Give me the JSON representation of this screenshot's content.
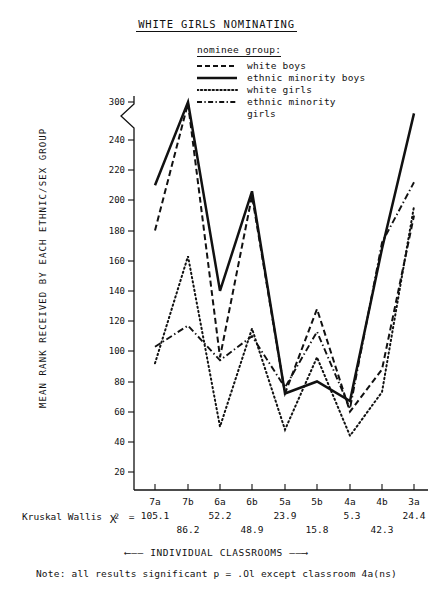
{
  "title": "WHITE GIRLS NOMINATING",
  "legend": {
    "heading": "nominee group:",
    "items": [
      {
        "label": "white boys",
        "style": "dashed"
      },
      {
        "label": "ethnic minority boys",
        "style": "solid"
      },
      {
        "label": "white girls",
        "style": "dotted"
      },
      {
        "label": "ethnic minority",
        "label2": "girls",
        "style": "dashdot"
      }
    ]
  },
  "axes": {
    "ylabel": "MEAN RANK RECEIVED BY EACH ETHNIC/SEX GROUP",
    "yticks": [
      "20",
      "40",
      "60",
      "80",
      "100",
      "120",
      "140",
      "160",
      "180",
      "200",
      "220",
      "240",
      "300"
    ],
    "xcaption": "INDIVIDUAL CLASSROOMS",
    "axis_break": true
  },
  "stats": {
    "kw_label": "Kruskal Wallis",
    "chi_symbol": "X",
    "chi_exponent": "2",
    "equals": "=",
    "values": [
      "105.1",
      "86.2",
      "52.2",
      "48.9",
      "23.9",
      "15.8",
      "5.3",
      "42.3",
      "24.4"
    ]
  },
  "note": "Note:  all  results  significant p = .Ol except classroom 4a(ns)",
  "chart_data": {
    "type": "line",
    "title": "WHITE GIRLS NOMINATING",
    "xlabel": "INDIVIDUAL CLASSROOMS",
    "ylabel": "MEAN RANK RECEIVED BY EACH ETHNIC/SEX GROUP",
    "categories": [
      "7a",
      "7b",
      "6a",
      "6b",
      "5a",
      "5b",
      "4a",
      "4b",
      "3a"
    ],
    "ylim": [
      20,
      300
    ],
    "yticks": [
      20,
      40,
      60,
      80,
      100,
      120,
      140,
      160,
      180,
      200,
      220,
      240,
      300
    ],
    "axis_break_between": [
      240,
      300
    ],
    "grid": false,
    "legend_position": "top-right",
    "series": [
      {
        "name": "white boys",
        "style": "dashed",
        "values": [
          180,
          298,
          96,
          203,
          72,
          128,
          60,
          88,
          190
        ]
      },
      {
        "name": "ethnic minority boys",
        "style": "solid",
        "values": [
          210,
          300,
          140,
          206,
          72,
          80,
          67,
          168,
          282
        ]
      },
      {
        "name": "white girls",
        "style": "dotted",
        "values": [
          92,
          163,
          50,
          115,
          48,
          96,
          44,
          73,
          196
        ]
      },
      {
        "name": "ethnic minority girls",
        "style": "dashdot",
        "values": [
          103,
          117,
          94,
          110,
          76,
          113,
          62,
          172,
          212
        ]
      }
    ],
    "kruskal_wallis_chi2": {
      "7a": 105.1,
      "7b": 86.2,
      "6a": 52.2,
      "6b": 48.9,
      "5a": 23.9,
      "5b": 15.8,
      "4a": 5.3,
      "4b": 42.3,
      "3a": 24.4
    },
    "annotation": "Note:  all  results  significant p = .Ol except classroom 4a(ns)"
  }
}
